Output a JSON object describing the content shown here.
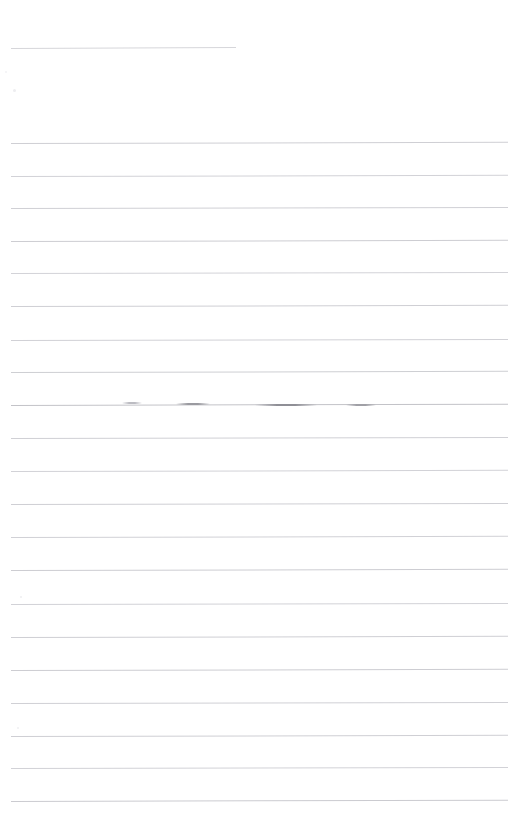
{
  "document": {
    "kind": "scanned-ruled-page",
    "description": "Faded scan of a blank lined sheet of paper",
    "page_number": "",
    "body_text": "",
    "background_color": "#ffffff",
    "page_width": 523,
    "page_height": 840
  },
  "rules": {
    "default_color": "#d2d2d6",
    "left_x": 11,
    "right_x": 507,
    "spacing": 32,
    "items": [
      {
        "id": "rule-1",
        "y": 48,
        "x1": 11,
        "x2": 236,
        "color": "#d6d6da",
        "thickness": 1,
        "slope": -0.9,
        "short": true
      },
      {
        "id": "rule-2",
        "y": 143,
        "x1": 11,
        "x2": 508,
        "color": "#cfcfd4",
        "thickness": 1,
        "slope": -1.2,
        "short": false
      },
      {
        "id": "rule-3",
        "y": 176,
        "x1": 11,
        "x2": 508,
        "color": "#d2d2d7",
        "thickness": 1,
        "slope": -1.2,
        "short": false
      },
      {
        "id": "rule-4",
        "y": 208,
        "x1": 11,
        "x2": 508,
        "color": "#d0d0d5",
        "thickness": 1,
        "slope": -1.0,
        "short": false
      },
      {
        "id": "rule-5",
        "y": 241,
        "x1": 11,
        "x2": 508,
        "color": "#cdcdd2",
        "thickness": 1,
        "slope": -1.2,
        "short": false
      },
      {
        "id": "rule-6",
        "y": 273,
        "x1": 11,
        "x2": 508,
        "color": "#d3d3d8",
        "thickness": 1,
        "slope": -1.1,
        "short": false
      },
      {
        "id": "rule-7",
        "y": 306,
        "x1": 11,
        "x2": 508,
        "color": "#cfcfd4",
        "thickness": 1,
        "slope": -1.2,
        "short": false
      },
      {
        "id": "rule-8",
        "y": 340,
        "x1": 11,
        "x2": 508,
        "color": "#d1d1d6",
        "thickness": 1,
        "slope": -1.1,
        "short": false
      },
      {
        "id": "rule-9",
        "y": 372,
        "x1": 11,
        "x2": 508,
        "color": "#cecfd3",
        "thickness": 1,
        "slope": -1.2,
        "short": false
      },
      {
        "id": "rule-10",
        "y": 405,
        "x1": 11,
        "x2": 508,
        "color": "#c3c3c8",
        "thickness": 1.2,
        "slope": -1.3,
        "short": false
      },
      {
        "id": "rule-11",
        "y": 438,
        "x1": 11,
        "x2": 508,
        "color": "#d0d0d5",
        "thickness": 1,
        "slope": -1.1,
        "short": false
      },
      {
        "id": "rule-12",
        "y": 471,
        "x1": 11,
        "x2": 508,
        "color": "#d2d2d7",
        "thickness": 1,
        "slope": -1.2,
        "short": false
      },
      {
        "id": "rule-13",
        "y": 504,
        "x1": 11,
        "x2": 508,
        "color": "#cfcfd4",
        "thickness": 1,
        "slope": -1.1,
        "short": false
      },
      {
        "id": "rule-14",
        "y": 537,
        "x1": 11,
        "x2": 508,
        "color": "#d1d1d6",
        "thickness": 1,
        "slope": -1.2,
        "short": false
      },
      {
        "id": "rule-15",
        "y": 570,
        "x1": 11,
        "x2": 508,
        "color": "#cdcdd2",
        "thickness": 1,
        "slope": -1.2,
        "short": false
      },
      {
        "id": "rule-16",
        "y": 604,
        "x1": 11,
        "x2": 508,
        "color": "#d2d2d7",
        "thickness": 1,
        "slope": -1.1,
        "short": false
      },
      {
        "id": "rule-17",
        "y": 637,
        "x1": 11,
        "x2": 508,
        "color": "#cfcfd4",
        "thickness": 1,
        "slope": -1.2,
        "short": false
      },
      {
        "id": "rule-18",
        "y": 670,
        "x1": 11,
        "x2": 508,
        "color": "#cdcdd2",
        "thickness": 1,
        "slope": -1.2,
        "short": false
      },
      {
        "id": "rule-19",
        "y": 703,
        "x1": 11,
        "x2": 508,
        "color": "#d0d0d5",
        "thickness": 1,
        "slope": -1.1,
        "short": false
      },
      {
        "id": "rule-20",
        "y": 736,
        "x1": 11,
        "x2": 508,
        "color": "#cfcfd4",
        "thickness": 1,
        "slope": -1.2,
        "short": false
      },
      {
        "id": "rule-21",
        "y": 768,
        "x1": 11,
        "x2": 508,
        "color": "#d2d2d7",
        "thickness": 1,
        "slope": -1.1,
        "short": false
      },
      {
        "id": "rule-22",
        "y": 801,
        "x1": 11,
        "x2": 508,
        "color": "#cbcbd0",
        "thickness": 1,
        "slope": -1.3,
        "short": false
      }
    ]
  },
  "smudges": {
    "on_rule": "rule-10",
    "items": [
      {
        "id": "smudge-1",
        "x": 176,
        "y": 403,
        "width": 34,
        "color": "#9a9aa0"
      },
      {
        "id": "smudge-2",
        "x": 255,
        "y": 404,
        "width": 62,
        "color": "#8f8f96"
      },
      {
        "id": "smudge-3",
        "x": 346,
        "y": 404,
        "width": 30,
        "color": "#a0a0a6"
      },
      {
        "id": "smudge-4",
        "x": 122,
        "y": 402,
        "width": 20,
        "color": "#bcbcc2"
      }
    ]
  },
  "specks": {
    "items": [
      {
        "id": "speck-1",
        "x": 13,
        "y": 89,
        "size": 3,
        "color": "#ededf0"
      },
      {
        "id": "speck-2",
        "x": 5,
        "y": 71,
        "size": 2,
        "color": "#f2f2f4"
      },
      {
        "id": "speck-3",
        "x": 20,
        "y": 596,
        "size": 2,
        "color": "#eeeef1"
      },
      {
        "id": "speck-4",
        "x": 17,
        "y": 727,
        "size": 2,
        "color": "#efeff2"
      }
    ]
  }
}
